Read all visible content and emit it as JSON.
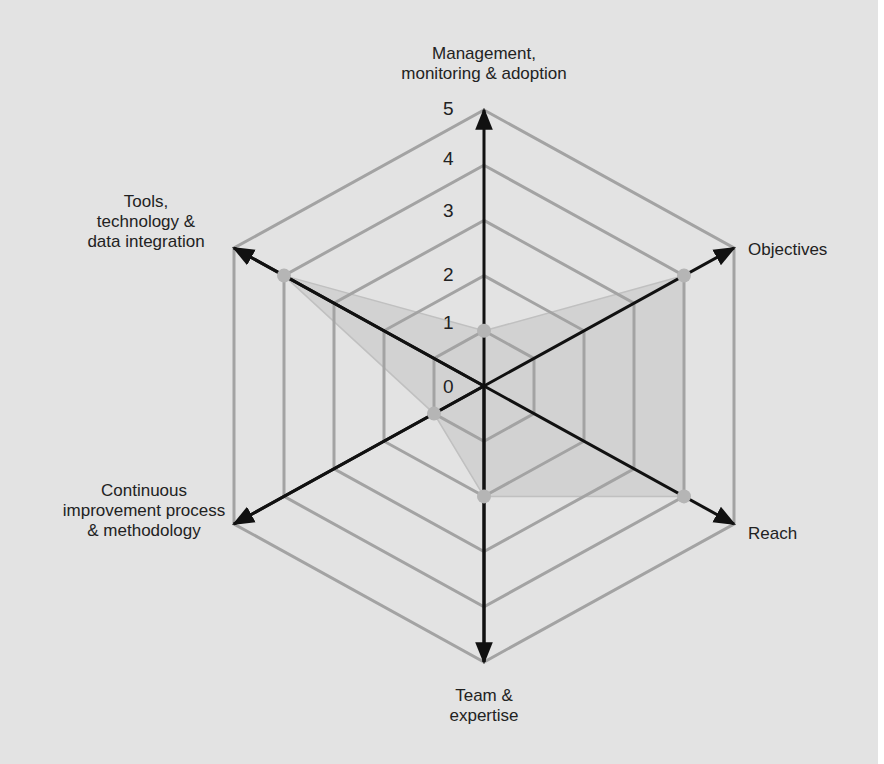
{
  "chart_data": {
    "type": "radar",
    "title": "",
    "axes": [
      "Management, monitoring & adoption",
      "Objectives",
      "Reach",
      "Team & expertise",
      "Continuous improvement process & methodology",
      "Tools, technology & data integration"
    ],
    "series": [
      {
        "name": "Score",
        "values": [
          1,
          4,
          4,
          2,
          1,
          4
        ]
      }
    ],
    "scale": {
      "min": 0,
      "max": 5,
      "ticks": [
        "0",
        "1",
        "2",
        "3",
        "4",
        "5"
      ]
    },
    "colors": {
      "background": "#e3e3e3",
      "fill": "#d2d2d2",
      "grid": "#a3a3a3",
      "axis": "#111111",
      "point": "#b5b5b5"
    }
  },
  "labels": {
    "management": "Management,\nmonitoring & adoption",
    "objectives": "Objectives",
    "reach": "Reach",
    "team": "Team &\nexpertise",
    "continuous": "Continuous\nimprovement process\n& methodology",
    "tools": "Tools,\ntechnology &\ndata integration"
  },
  "ticks": {
    "t0": "0",
    "t1": "1",
    "t2": "2",
    "t3": "3",
    "t4": "4",
    "t5": "5"
  }
}
